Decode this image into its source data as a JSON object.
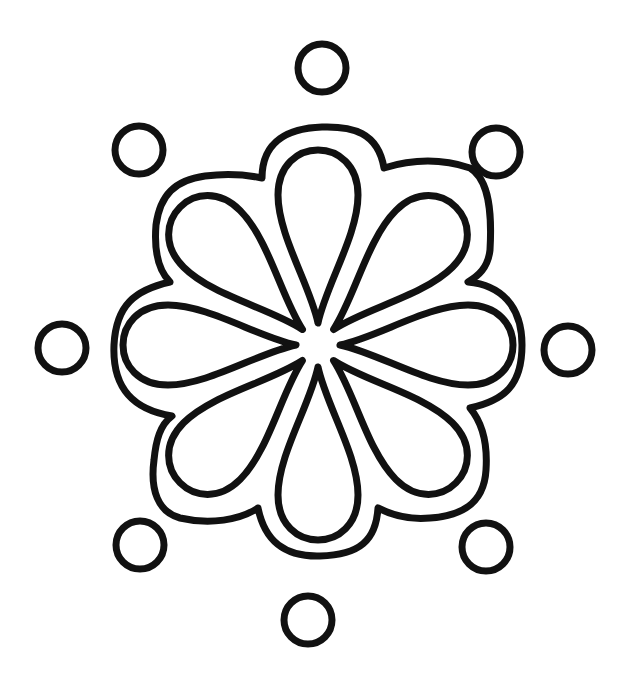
{
  "image": {
    "subject": "flower line art",
    "style": "black outline on white",
    "stroke_color": "#111111",
    "background_color": "#ffffff",
    "petal_count": 8,
    "dot_count": 8
  }
}
